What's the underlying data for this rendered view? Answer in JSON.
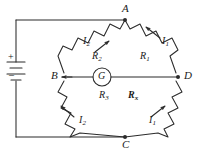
{
  "figure": {
    "stroke_color": "#2b2b2b",
    "text_color": "#1a1a1a",
    "background": "#ffffff"
  },
  "nodes": [
    {
      "id": "A",
      "label": "A"
    },
    {
      "id": "B",
      "label": "B"
    },
    {
      "id": "C",
      "label": "C"
    },
    {
      "id": "D",
      "label": "D"
    }
  ],
  "resistors": [
    {
      "id": "R1",
      "label": "R",
      "sub": "1",
      "bold": false
    },
    {
      "id": "R2",
      "label": "R",
      "sub": "2",
      "bold": false
    },
    {
      "id": "R3",
      "label": "R",
      "sub": "3",
      "bold": false
    },
    {
      "id": "Rx",
      "label": "R",
      "sub": "x",
      "bold": true
    }
  ],
  "currents": [
    {
      "id": "I1_top",
      "label": "I",
      "sub": "1"
    },
    {
      "id": "I2_top",
      "label": "I",
      "sub": "2"
    },
    {
      "id": "I1_bottom",
      "label": "I",
      "sub": "1"
    },
    {
      "id": "I2_bottom",
      "label": "I",
      "sub": "2"
    }
  ],
  "galvanometer": {
    "label": "G"
  },
  "battery": {
    "plus": "+",
    "minus": "–"
  }
}
